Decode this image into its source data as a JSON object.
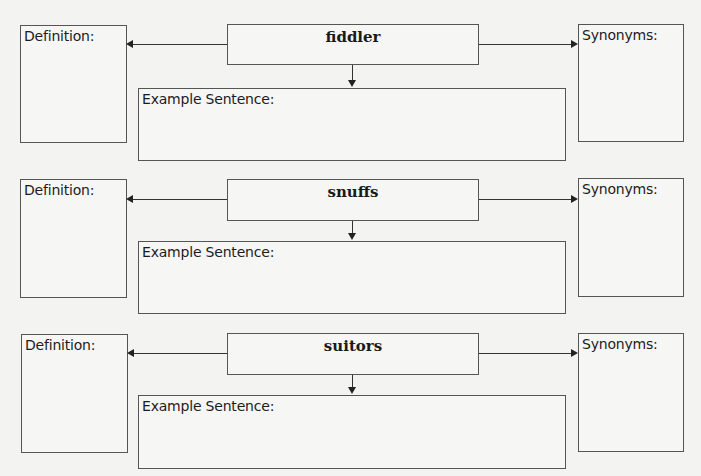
{
  "labels": {
    "definition": "Definition:",
    "synonyms": "Synonyms:",
    "example": "Example Sentence:"
  },
  "sections": [
    {
      "word": "fiddler"
    },
    {
      "word": "snuffs"
    },
    {
      "word": "suitors"
    }
  ]
}
